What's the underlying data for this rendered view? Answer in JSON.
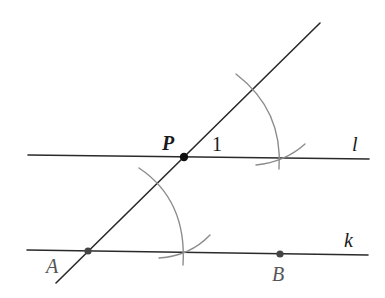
{
  "diagram": {
    "colors": {
      "line": "#2a2a2a",
      "arc": "#8c8c8c",
      "point": "#111111",
      "background": "#ffffff"
    },
    "lines": [
      {
        "id": "l",
        "label": "l",
        "x1": 28,
        "y1": 155,
        "x2": 369,
        "y2": 159
      },
      {
        "id": "k",
        "label": "k",
        "x1": 27,
        "y1": 250,
        "x2": 368,
        "y2": 255
      },
      {
        "id": "transversal",
        "label": "",
        "x1": 56,
        "y1": 283,
        "x2": 320,
        "y2": 23
      }
    ],
    "points": [
      {
        "id": "P",
        "label": "P",
        "x": 184,
        "y": 157
      },
      {
        "id": "A",
        "label": "A",
        "x": 88,
        "y": 251
      },
      {
        "id": "B",
        "label": "B",
        "x": 280,
        "y": 254
      }
    ],
    "angle_label": {
      "text": "1",
      "x": 212,
      "y": 151
    },
    "labels": {
      "P": "P",
      "A": "A",
      "B": "B",
      "l": "l",
      "k": "k",
      "angle1": "1"
    }
  }
}
